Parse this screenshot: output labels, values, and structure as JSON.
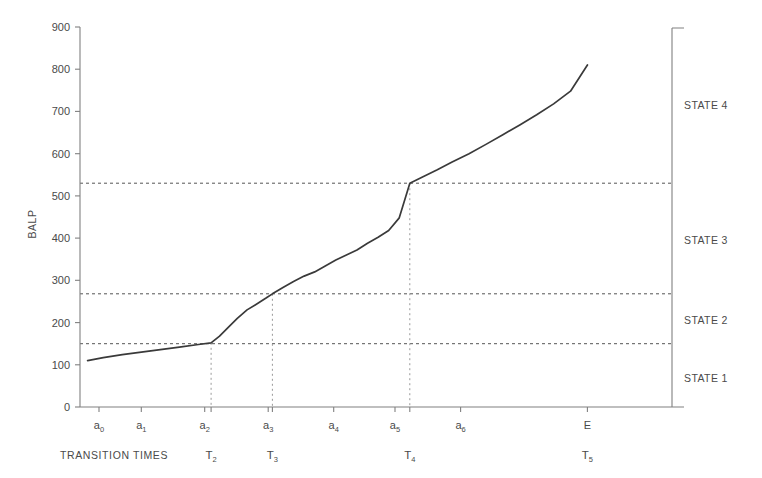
{
  "chart_data": {
    "type": "line",
    "title": "",
    "xlabel": "TRANSITION TIMES",
    "ylabel": "BALP",
    "ylim": [
      0,
      900
    ],
    "ytick_labels": [
      "0",
      "100",
      "200",
      "300",
      "400",
      "500",
      "600",
      "700",
      "800",
      "900"
    ],
    "ytick_values": [
      0,
      100,
      200,
      300,
      400,
      500,
      600,
      700,
      800,
      900
    ],
    "xlim": [
      0,
      14
    ],
    "grid": false,
    "legend": "none",
    "x_category_labels": [
      "a0",
      "a1",
      "a2",
      "a3",
      "a4",
      "a5",
      "a6",
      "E"
    ],
    "x_category_sub": [
      "0",
      "1",
      "2",
      "3",
      "4",
      "5",
      "6",
      ""
    ],
    "x_category_base": [
      "a",
      "a",
      "a",
      "a",
      "a",
      "a",
      "a",
      "E"
    ],
    "x_category_positions": [
      0.45,
      1.45,
      2.95,
      4.45,
      6.0,
      7.45,
      9.0,
      12.0
    ],
    "transition_labels": [
      "T2",
      "T3",
      "T4",
      "T5"
    ],
    "transition_sub": [
      "2",
      "3",
      "4",
      "5"
    ],
    "transition_positions": [
      3.1,
      4.55,
      7.8,
      12.0
    ],
    "transition_marker_positions": [
      3.1,
      4.55,
      7.8
    ],
    "threshold_values": [
      150,
      268,
      530
    ],
    "state_labels": [
      "STATE 1",
      "STATE 2",
      "STATE 3",
      "STATE 4"
    ],
    "state_label_values": [
      68,
      205,
      395,
      715
    ],
    "series": [
      {
        "name": "BALP",
        "x": [
          0.18,
          0.55,
          1.0,
          1.45,
          1.9,
          2.35,
          2.8,
          3.1,
          3.3,
          3.5,
          3.72,
          3.95,
          4.18,
          4.4,
          4.55,
          4.8,
          5.05,
          5.3,
          5.55,
          5.8,
          6.05,
          6.3,
          6.55,
          6.8,
          7.05,
          7.3,
          7.55,
          7.8,
          8.1,
          8.45,
          8.8,
          9.2,
          9.6,
          10.0,
          10.4,
          10.8,
          11.2,
          11.6,
          12.0
        ],
        "values": [
          110,
          117,
          124,
          130,
          136,
          142,
          148,
          152,
          168,
          188,
          210,
          230,
          244,
          258,
          268,
          283,
          297,
          310,
          320,
          334,
          348,
          360,
          372,
          388,
          402,
          418,
          448,
          530,
          545,
          562,
          580,
          600,
          622,
          645,
          668,
          692,
          718,
          748,
          810
        ]
      }
    ],
    "annotations": {
      "curve_color": "#3a3a3a",
      "axis_color": "#808080",
      "dash_color": "#555555",
      "dot_color": "#999999"
    }
  },
  "axes": {
    "y_axis_name": "balp-axis",
    "x_axis_name": "transition-times-axis",
    "right_bracket_name": "state-bracket"
  }
}
